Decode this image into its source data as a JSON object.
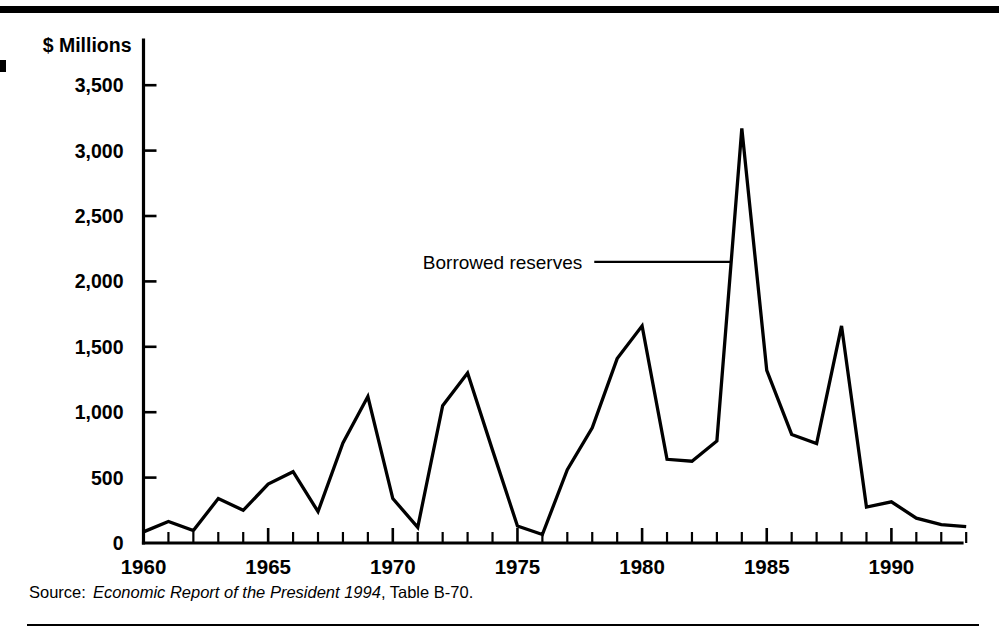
{
  "figure": {
    "source_prefix": "Source:",
    "source_title": "Economic Report of the President 1994",
    "source_rest": ", Table B-70."
  },
  "chart_data": {
    "type": "line",
    "title": "",
    "subtitle": "",
    "xlabel": "",
    "ylabel": "$ Millions",
    "xlim": [
      1960,
      1993
    ],
    "ylim": [
      0,
      3750
    ],
    "yticks": [
      0,
      500,
      1000,
      1500,
      2000,
      2500,
      3000,
      3500
    ],
    "ytick_labels": [
      "0",
      "500",
      "1,000",
      "1,500",
      "2,000",
      "2,500",
      "3,000",
      "3,500"
    ],
    "xticks_major": [
      1960,
      1965,
      1970,
      1975,
      1980,
      1985,
      1990
    ],
    "xtick_labels": [
      "1960",
      "1965",
      "1970",
      "1975",
      "1980",
      "1985",
      "1990"
    ],
    "xticks_minor_step": 1,
    "grid": false,
    "legend_position": "none",
    "annotations": [
      {
        "text": "Borrowed reserves",
        "target_x": 1983.6,
        "target_y": 2150,
        "label_x": 1977.6,
        "label_y": 2150
      }
    ],
    "series": [
      {
        "name": "Borrowed reserves",
        "x": [
          1960,
          1961,
          1962,
          1963,
          1964,
          1965,
          1966,
          1967,
          1968,
          1969,
          1970,
          1971,
          1972,
          1973,
          1974,
          1975,
          1976,
          1977,
          1978,
          1979,
          1980,
          1981,
          1982,
          1983,
          1984,
          1985,
          1986,
          1987,
          1988,
          1989,
          1990,
          1991,
          1992,
          1993
        ],
        "values": [
          85,
          165,
          95,
          340,
          250,
          450,
          545,
          240,
          765,
          1120,
          340,
          120,
          1050,
          1300,
          710,
          130,
          65,
          560,
          880,
          1410,
          1660,
          640,
          625,
          780,
          3170,
          1320,
          830,
          760,
          1660,
          275,
          315,
          190,
          140,
          125
        ]
      }
    ]
  }
}
